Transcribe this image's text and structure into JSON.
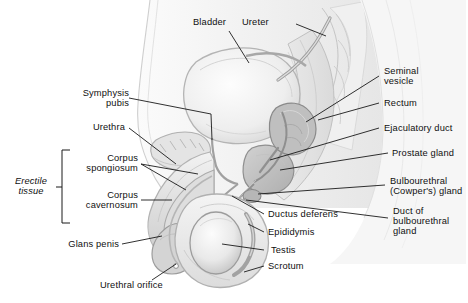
{
  "figure": {
    "background": "#ffffff",
    "line_color": "#1a1a1a",
    "tone_light": "#f0f0f0",
    "tone_mid": "#d9d9d9",
    "tone_dark": "#b8b8b8",
    "tone_deep": "#9a9a9a"
  },
  "labels": {
    "bladder": "Bladder",
    "ureter": "Ureter",
    "symphysis_pubis_l1": "Symphysis",
    "symphysis_pubis_l2": "pubis",
    "urethra": "Urethra",
    "erectile_tissue_l1": "Erectile",
    "erectile_tissue_l2": "tissue",
    "corpus_spongiosum_l1": "Corpus",
    "corpus_spongiosum_l2": "spongiosum",
    "corpus_cavernosum_l1": "Corpus",
    "corpus_cavernosum_l2": "cavernosum",
    "glans_penis": "Glans penis",
    "urethral_orifice": "Urethral orifice",
    "seminal_vesicle_l1": "Seminal",
    "seminal_vesicle_l2": "vesicle",
    "rectum": "Rectum",
    "ejaculatory_duct": "Ejaculatory duct",
    "prostate_gland": "Prostate gland",
    "bulbourethral_l1": "Bulbourethral",
    "bulbourethral_l2": "(Cowper's) gland",
    "duct_bulbourethral_l1": "Duct of",
    "duct_bulbourethral_l2": "bulbourethral",
    "duct_bulbourethral_l3": "gland",
    "ductus_deferens": "Ductus deferens",
    "epididymis": "Epididymis",
    "testis": "Testis",
    "scrotum": "Scrotum"
  }
}
